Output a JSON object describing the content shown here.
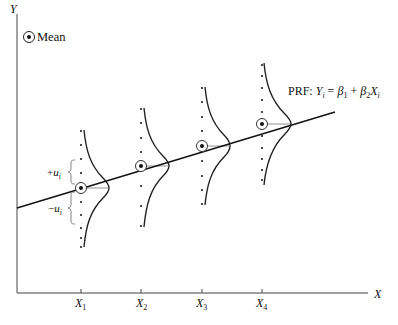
{
  "figure": {
    "y_axis_label": "Y",
    "x_axis_label": "X",
    "legend": {
      "symbol": "circled-dot",
      "label": "Mean"
    },
    "prf_label": {
      "prefix": "PRF: ",
      "Y": "Y",
      "sub_i": "i",
      "eq": " = ",
      "beta": "β",
      "sub1": "1",
      "plus": " + ",
      "sub2": "2",
      "X": "X"
    },
    "x_ticks": [
      {
        "label": "X",
        "sub": "1"
      },
      {
        "label": "X",
        "sub": "2"
      },
      {
        "label": "X",
        "sub": "3"
      },
      {
        "label": "X",
        "sub": "4"
      }
    ],
    "deviation_labels": {
      "plus": {
        "sign": "+",
        "u": "u",
        "sub": "i"
      },
      "minus": {
        "sign": "−",
        "u": "u",
        "sub": "i"
      }
    }
  },
  "diagram": {
    "type": "population-regression-function",
    "distributions": [
      {
        "x": "X1",
        "mean_marked": true
      },
      {
        "x": "X2",
        "mean_marked": true
      },
      {
        "x": "X3",
        "mean_marked": true
      },
      {
        "x": "X4",
        "mean_marked": true
      }
    ],
    "line": "PRF: Yi = β1 + β2 Xi"
  }
}
